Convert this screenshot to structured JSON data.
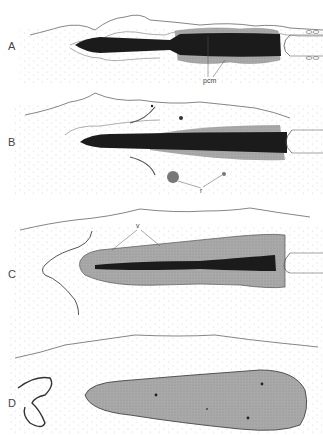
{
  "figure": {
    "panels": [
      {
        "id": "A",
        "letter": "A",
        "labels": [
          {
            "text": "pcm"
          }
        ]
      },
      {
        "id": "B",
        "letter": "B",
        "labels": [
          {
            "text": "r"
          }
        ]
      },
      {
        "id": "C",
        "letter": "C",
        "labels": [
          {
            "text": "v"
          }
        ]
      },
      {
        "id": "D",
        "letter": "D",
        "labels": []
      }
    ]
  },
  "colors": {
    "background": "#ffffff",
    "outline": "#555555",
    "dark_core": "#1a1a1a",
    "grey_mantle": "#a8a8a8",
    "stipple": "#bdbdbd"
  }
}
